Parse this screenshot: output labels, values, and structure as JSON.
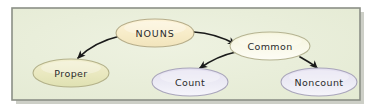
{
  "diagram": {
    "panel": {
      "background_color": "#e9eed9",
      "border_color": "#8b8f86",
      "shadow_color": "#b9bcb2",
      "x": 12,
      "y": 8,
      "width": 348,
      "height": 92
    },
    "nodes": [
      {
        "id": "nouns",
        "label": "NOUNS",
        "cx": 155,
        "cy": 33,
        "rx": 39,
        "ry": 14,
        "fill_top": "#fdf3d8",
        "fill_bottom": "#f1e4bc",
        "stroke_color": "#b6ad8a",
        "style": "caps",
        "level": 0
      },
      {
        "id": "proper",
        "label": "Proper",
        "cx": 71,
        "cy": 73,
        "rx": 38,
        "ry": 14,
        "fill_top": "#eeecc6",
        "fill_bottom": "#e2e3b6",
        "stroke_color": "#b3b189",
        "style": "normal",
        "level": 1
      },
      {
        "id": "common",
        "label": "Common",
        "cx": 270,
        "cy": 46,
        "rx": 40,
        "ry": 14,
        "fill_top": "#f7f6df",
        "fill_bottom": "#fbfbf2",
        "stroke_color": "#b5b392",
        "style": "normal",
        "level": 1
      },
      {
        "id": "count",
        "label": "Count",
        "cx": 190,
        "cy": 82,
        "rx": 38,
        "ry": 14,
        "fill_top": "#e6e2f0",
        "fill_bottom": "#f3f1f8",
        "stroke_color": "#a9a5bb",
        "style": "normal",
        "level": 2
      },
      {
        "id": "noncount",
        "label": "Noncount",
        "cx": 319,
        "cy": 82,
        "rx": 38,
        "ry": 14,
        "fill_top": "#e6e2f0",
        "fill_bottom": "#f3f1f8",
        "stroke_color": "#a9a5bb",
        "style": "normal",
        "level": 2
      }
    ],
    "edges": [
      {
        "id": "nouns-to-proper",
        "from": "nouns",
        "to": "proper",
        "path": "M 120 36 C 103 40, 88 48, 78 58",
        "color": "#1a1a1a"
      },
      {
        "id": "nouns-to-common",
        "from": "nouns",
        "to": "common",
        "path": "M 194 32 C 210 33, 224 38, 235 44",
        "color": "#1a1a1a"
      },
      {
        "id": "common-to-count",
        "from": "common",
        "to": "count",
        "path": "M 236 52 C 222 55, 210 60, 200 68",
        "color": "#1a1a1a"
      },
      {
        "id": "common-to-noncount",
        "from": "common",
        "to": "noncount",
        "path": "M 300 56 C 308 60, 314 63, 318 68",
        "color": "#1a1a1a"
      }
    ]
  }
}
